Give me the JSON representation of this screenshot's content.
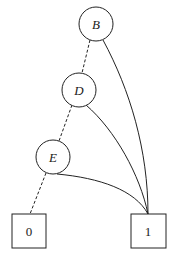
{
  "diagram": {
    "type": "binary decision diagram",
    "nodes": [
      {
        "id": "B",
        "label": "B",
        "shape": "circle",
        "cx": 96,
        "cy": 24,
        "r": 17
      },
      {
        "id": "D",
        "label": "D",
        "shape": "circle",
        "cx": 79,
        "cy": 90,
        "r": 17
      },
      {
        "id": "E",
        "label": "E",
        "shape": "circle",
        "cx": 53,
        "cy": 157,
        "r": 17
      }
    ],
    "terminals": [
      {
        "id": "0",
        "label": "0",
        "shape": "square",
        "x": 12,
        "y": 214,
        "w": 34,
        "h": 34
      },
      {
        "id": "1",
        "label": "1",
        "shape": "square",
        "x": 131,
        "y": 214,
        "w": 35,
        "h": 34
      }
    ],
    "edges": [
      {
        "from": "B",
        "to": "D",
        "style": "dashed"
      },
      {
        "from": "D",
        "to": "E",
        "style": "dashed"
      },
      {
        "from": "E",
        "to": "0",
        "style": "dashed"
      },
      {
        "from": "B",
        "to": "1",
        "style": "solid"
      },
      {
        "from": "D",
        "to": "1",
        "style": "solid"
      },
      {
        "from": "E",
        "to": "1",
        "style": "solid"
      }
    ]
  }
}
